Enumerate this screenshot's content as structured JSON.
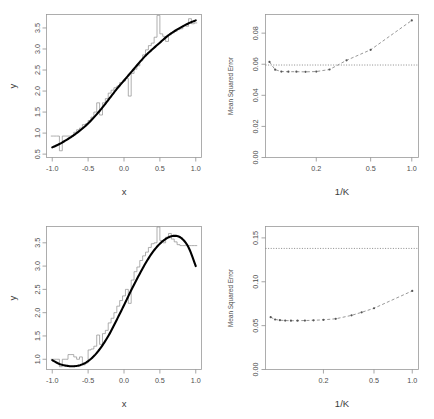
{
  "figure": {
    "title": "",
    "panel_count": 4,
    "background": "#ffffff"
  },
  "panels": {
    "top_left": {
      "name": "top-left-scatter-step",
      "xlabel": "x",
      "ylabel": "y",
      "xticks": [
        "-1.0",
        "-0.5",
        "0.0",
        "0.5",
        "1.0"
      ],
      "yticks": [
        "0.5",
        "1.0",
        "1.5",
        "2.0",
        "2.5",
        "3.0",
        "3.5"
      ]
    },
    "top_right": {
      "name": "top-right-mse",
      "xlabel": "1/K",
      "ylabel": "Mean Squared Error",
      "xticks": [
        "0.2",
        "0.5",
        "1.0"
      ],
      "yticks": [
        "0.00",
        "0.02",
        "0.04",
        "0.06",
        "0.08"
      ]
    },
    "bottom_left": {
      "name": "bottom-left-scatter-step",
      "xlabel": "x",
      "ylabel": "y",
      "xticks": [
        "-1.0",
        "-0.5",
        "0.0",
        "0.5",
        "1.0"
      ],
      "yticks": [
        "1.0",
        "1.5",
        "2.0",
        "2.5",
        "3.0",
        "3.5"
      ]
    },
    "bottom_right": {
      "name": "bottom-right-mse",
      "xlabel": "1/K",
      "ylabel": "Mean Squared Error",
      "xticks": [
        "0.2",
        "0.5",
        "1.0"
      ],
      "yticks": [
        "0.00",
        "0.05",
        "0.10",
        "0.15"
      ]
    }
  },
  "chart_data": [
    {
      "id": "top_left",
      "type": "line",
      "title": "",
      "xlabel": "x",
      "ylabel": "y",
      "xlim": [
        -1.08,
        1.08
      ],
      "ylim": [
        0.42,
        3.82
      ],
      "xticks": [
        -1.0,
        -0.5,
        0.0,
        0.5,
        1.0
      ],
      "yticks": [
        0.5,
        1.0,
        1.5,
        2.0,
        2.5,
        3.0,
        3.5
      ],
      "grid": false,
      "legend": "none",
      "series": [
        {
          "name": "true function (smooth)",
          "style": "solid-black-thick",
          "x": [
            -1.0,
            -0.9,
            -0.8,
            -0.7,
            -0.6,
            -0.5,
            -0.4,
            -0.3,
            -0.2,
            -0.1,
            0.0,
            0.1,
            0.2,
            0.3,
            0.4,
            0.5,
            0.6,
            0.7,
            0.8,
            0.9,
            1.0
          ],
          "y": [
            0.66,
            0.74,
            0.84,
            0.95,
            1.08,
            1.23,
            1.41,
            1.61,
            1.83,
            2.05,
            2.25,
            2.45,
            2.65,
            2.84,
            3.0,
            3.15,
            3.3,
            3.42,
            3.52,
            3.61,
            3.68
          ]
        },
        {
          "name": "knn step estimate",
          "style": "thin-gray-step",
          "x": [
            -1.0,
            -0.96,
            -0.92,
            -0.88,
            -0.84,
            -0.8,
            -0.76,
            -0.72,
            -0.68,
            -0.64,
            -0.6,
            -0.56,
            -0.52,
            -0.48,
            -0.44,
            -0.4,
            -0.36,
            -0.32,
            -0.28,
            -0.24,
            -0.2,
            -0.16,
            -0.12,
            -0.08,
            -0.04,
            0.0,
            0.04,
            0.08,
            0.12,
            0.16,
            0.2,
            0.24,
            0.28,
            0.32,
            0.36,
            0.4,
            0.44,
            0.48,
            0.52,
            0.56,
            0.6,
            0.64,
            0.68,
            0.72,
            0.76,
            0.8,
            0.84,
            0.88,
            0.92,
            0.96,
            1.0
          ],
          "y": [
            0.93,
            0.93,
            0.93,
            0.58,
            0.93,
            0.93,
            0.93,
            0.93,
            1.02,
            1.08,
            1.12,
            1.2,
            1.22,
            1.3,
            1.38,
            1.5,
            1.72,
            1.43,
            1.72,
            1.82,
            1.95,
            2.02,
            2.08,
            2.12,
            2.2,
            2.24,
            2.3,
            1.88,
            2.42,
            2.52,
            2.6,
            2.72,
            2.86,
            2.98,
            3.08,
            3.14,
            3.28,
            3.8,
            3.36,
            3.3,
            3.18,
            3.34,
            3.38,
            3.42,
            3.46,
            3.48,
            3.56,
            3.54,
            3.72,
            3.6,
            3.62
          ]
        }
      ]
    },
    {
      "id": "top_right",
      "type": "line",
      "title": "",
      "xlabel": "1/K",
      "ylabel": "Mean Squared Error",
      "xscale": "log",
      "xlim": [
        0.085,
        1.12
      ],
      "ylim": [
        0.0,
        0.092
      ],
      "xticks": [
        0.2,
        0.5,
        1.0
      ],
      "yticks": [
        0.0,
        0.02,
        0.04,
        0.06,
        0.08
      ],
      "grid": false,
      "legend": "none",
      "reference_line": {
        "name": "linear-model-mse",
        "value": 0.0595,
        "style": "dotted"
      },
      "series": [
        {
          "name": "knn test mse",
          "style": "dashed-gray-with-points",
          "x": [
            0.0909,
            0.1,
            0.111,
            0.125,
            0.143,
            0.167,
            0.2,
            0.25,
            0.333,
            0.5,
            1.0
          ],
          "y": [
            0.0615,
            0.0565,
            0.0553,
            0.0552,
            0.0552,
            0.0551,
            0.0553,
            0.0566,
            0.0625,
            0.0693,
            0.0882
          ]
        }
      ]
    },
    {
      "id": "bottom_left",
      "type": "line",
      "title": "",
      "xlabel": "x",
      "ylabel": "y",
      "xlim": [
        -1.08,
        1.08
      ],
      "ylim": [
        0.78,
        3.85
      ],
      "xticks": [
        -1.0,
        -0.5,
        0.0,
        0.5,
        1.0
      ],
      "yticks": [
        1.0,
        1.5,
        2.0,
        2.5,
        3.0,
        3.5
      ],
      "grid": false,
      "legend": "none",
      "series": [
        {
          "name": "true function (smooth)",
          "style": "solid-black-thick",
          "x": [
            -1.0,
            -0.9,
            -0.8,
            -0.7,
            -0.6,
            -0.5,
            -0.4,
            -0.3,
            -0.2,
            -0.1,
            0.0,
            0.1,
            0.2,
            0.3,
            0.4,
            0.5,
            0.6,
            0.7,
            0.8,
            0.9,
            1.0
          ],
          "y": [
            0.98,
            0.9,
            0.86,
            0.85,
            0.88,
            0.96,
            1.1,
            1.3,
            1.55,
            1.85,
            2.16,
            2.48,
            2.78,
            3.06,
            3.3,
            3.48,
            3.6,
            3.65,
            3.6,
            3.4,
            3.0
          ]
        },
        {
          "name": "knn step estimate",
          "style": "thin-gray-step",
          "x": [
            -1.0,
            -0.96,
            -0.92,
            -0.88,
            -0.84,
            -0.8,
            -0.76,
            -0.72,
            -0.68,
            -0.64,
            -0.6,
            -0.56,
            -0.52,
            -0.48,
            -0.44,
            -0.4,
            -0.36,
            -0.32,
            -0.28,
            -0.24,
            -0.2,
            -0.16,
            -0.12,
            -0.08,
            -0.04,
            0.0,
            0.04,
            0.08,
            0.12,
            0.16,
            0.2,
            0.24,
            0.28,
            0.32,
            0.36,
            0.4,
            0.44,
            0.48,
            0.52,
            0.56,
            0.6,
            0.64,
            0.68,
            0.72,
            0.76,
            0.8,
            0.84,
            0.88,
            0.92,
            0.96,
            1.0
          ],
          "y": [
            1.0,
            1.0,
            1.0,
            0.84,
            1.0,
            1.0,
            1.1,
            1.1,
            1.05,
            1.0,
            1.05,
            0.88,
            0.92,
            1.2,
            1.22,
            1.28,
            1.52,
            1.32,
            1.55,
            1.62,
            1.78,
            1.88,
            2.0,
            2.14,
            2.26,
            2.36,
            2.5,
            2.2,
            2.7,
            2.88,
            2.98,
            3.12,
            3.22,
            3.3,
            3.4,
            3.48,
            3.5,
            3.84,
            3.55,
            3.5,
            3.62,
            3.7,
            3.58,
            3.52,
            3.46,
            3.44,
            3.44,
            3.44,
            3.44,
            3.44,
            3.44
          ]
        }
      ]
    },
    {
      "id": "bottom_right",
      "type": "line",
      "title": "",
      "xlabel": "1/K",
      "ylabel": "Mean Squared Error",
      "xscale": "log",
      "xlim": [
        0.07,
        1.12
      ],
      "ylim": [
        0.0,
        0.163
      ],
      "xticks": [
        0.2,
        0.5,
        1.0
      ],
      "yticks": [
        0.0,
        0.05,
        0.1,
        0.15
      ],
      "grid": false,
      "legend": "none",
      "reference_line": {
        "name": "linear-model-mse",
        "value": 0.138,
        "style": "dotted"
      },
      "series": [
        {
          "name": "knn test mse",
          "style": "dashed-gray-with-points",
          "x": [
            0.0769,
            0.0833,
            0.0909,
            0.1,
            0.111,
            0.125,
            0.143,
            0.167,
            0.2,
            0.25,
            0.333,
            0.4,
            0.5,
            1.0
          ],
          "y": [
            0.0596,
            0.057,
            0.0562,
            0.0558,
            0.0556,
            0.0557,
            0.0558,
            0.0561,
            0.0566,
            0.0578,
            0.0617,
            0.0652,
            0.0698,
            0.0896
          ]
        }
      ]
    }
  ]
}
